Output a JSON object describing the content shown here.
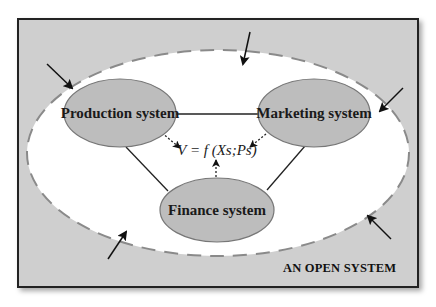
{
  "diagram": {
    "caption": "AN OPEN SYSTEM",
    "formula": "V = f (Xs;Ps)",
    "nodes": [
      {
        "id": "production",
        "label": "Production system"
      },
      {
        "id": "marketing",
        "label": "Marketing system"
      },
      {
        "id": "finance",
        "label": "Finance system"
      }
    ],
    "edges": [
      {
        "from": "production",
        "to": "marketing",
        "style": "solid"
      },
      {
        "from": "production",
        "to": "finance",
        "style": "solid"
      },
      {
        "from": "marketing",
        "to": "finance",
        "style": "solid"
      },
      {
        "from": "production",
        "to": "formula",
        "style": "dotted-arrow"
      },
      {
        "from": "marketing",
        "to": "formula",
        "style": "dotted-arrow"
      },
      {
        "from": "finance",
        "to": "formula",
        "style": "dotted-arrow"
      }
    ],
    "boundary": {
      "shape": "ellipse",
      "style": "dashed"
    },
    "external_inputs": 5,
    "colors": {
      "background": "#cfcfcf",
      "node_fill": "#bdbdbd",
      "system_area": "#ffffff",
      "lines": "#222222",
      "boundary_dash": "#888888"
    }
  }
}
